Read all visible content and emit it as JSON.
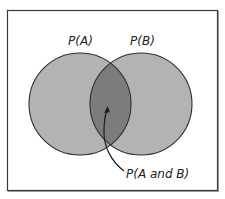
{
  "diagram": {
    "type": "venn",
    "sets": [
      {
        "id": "A",
        "label": "P(A)"
      },
      {
        "id": "B",
        "label": "P(B)"
      }
    ],
    "intersection": {
      "label": "P(A and B)"
    },
    "colors": {
      "frame": "#3a3a3a",
      "circle_fill": "#b3b3b3",
      "intersection_fill": "#7c7c7c",
      "circle_stroke": "#2e2e2e",
      "background": "#ffffff"
    }
  }
}
